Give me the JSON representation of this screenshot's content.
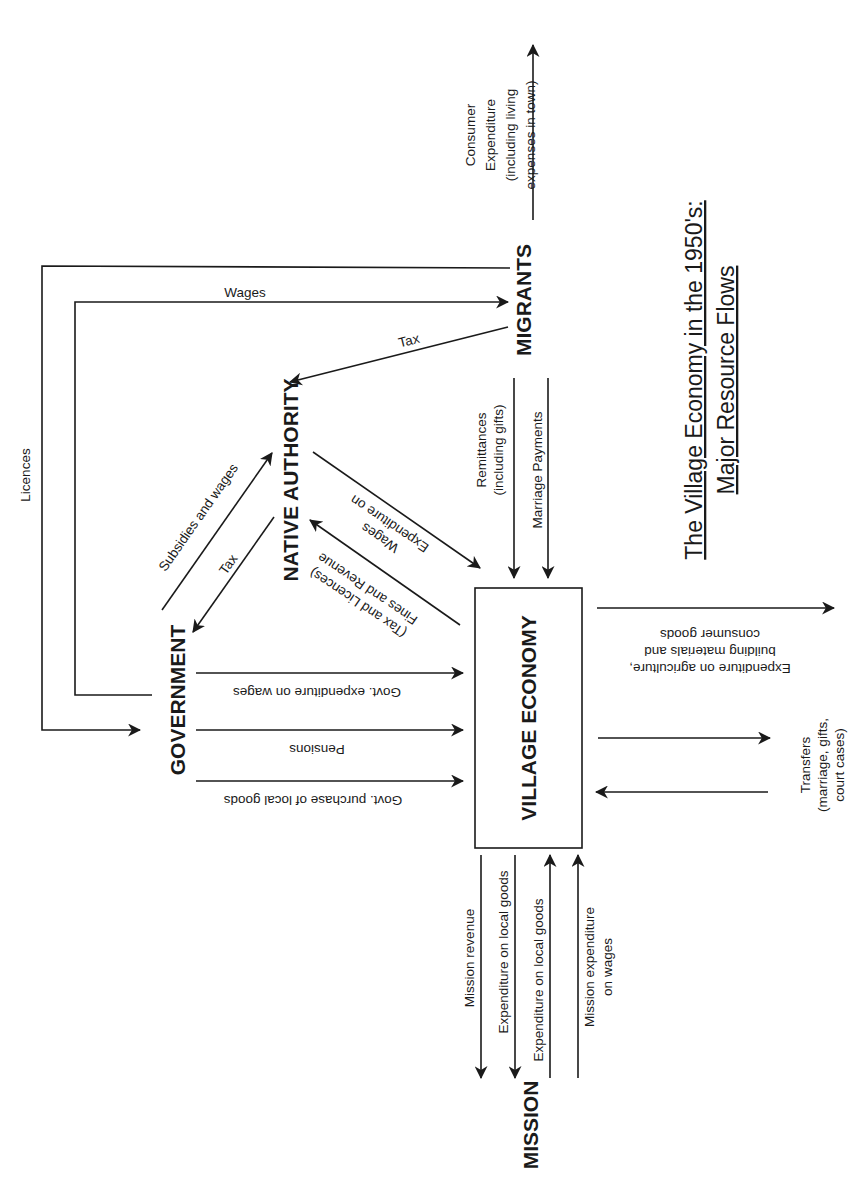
{
  "title": {
    "line1": "The Village Economy in the 1950's:",
    "line2": "Major Resource Flows"
  },
  "nodes": {
    "migrants": "MIGRANTS",
    "native_authority": "NATIVE AUTHORITY",
    "government": "GOVERNMENT",
    "village_economy": "VILLAGE ECONOMY",
    "mission": "MISSION"
  },
  "flows": {
    "consumer_expenditure": [
      "Consumer",
      "Expenditure",
      "(including living",
      "expenses in town)"
    ],
    "licences": "Licences",
    "wages": "Wages",
    "migrant_tax": "Tax",
    "remittances": [
      "Remittances",
      "(including gifts)"
    ],
    "marriage_payments": "Marriage Payments",
    "subsidies_and_wages": "Subsidies and wages",
    "na_tax": "Tax",
    "na_expenditure_wages": [
      "Expenditure on",
      "Wages"
    ],
    "fines_revenue": [
      "Fines and Revenue",
      "(Tax and Licences)"
    ],
    "govt_expenditure_wages": "Govt. expenditure on wages",
    "pensions": "Pensions",
    "govt_purchase_local_goods": "Govt. purchase of local goods",
    "village_expenditure_out": [
      "Expenditure on agriculture,",
      "building materials and",
      "consumer goods"
    ],
    "transfers": [
      "Transfers",
      "(marriage, gifts,",
      "court cases)"
    ],
    "mission_revenue": "Mission revenue",
    "expenditure_local_goods_to_mission": "Expenditure on local goods",
    "expenditure_local_goods_from_mission": "Expenditure on local goods",
    "mission_expenditure_wages": [
      "Mission expenditure",
      "on wages"
    ]
  },
  "colors": {
    "ink": "#1a1a1a",
    "background": "#ffffff"
  }
}
